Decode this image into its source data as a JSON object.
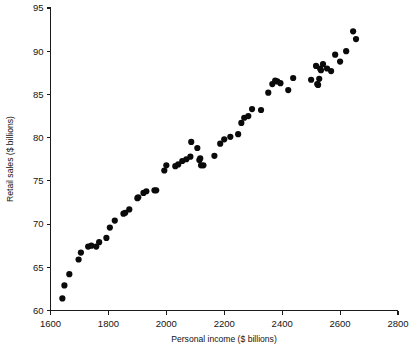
{
  "chart_data": {
    "type": "scatter",
    "title": "",
    "xlabel": "Personal income ($ billions)",
    "ylabel": "Retail sales ($ billions)",
    "xlim": [
      1600,
      2800
    ],
    "ylim": [
      60,
      95
    ],
    "xticks": [
      1600,
      1800,
      2000,
      2200,
      2400,
      2600,
      2800
    ],
    "yticks": [
      60,
      65,
      70,
      75,
      80,
      85,
      90,
      95
    ],
    "xtick_labels": [
      "1600",
      "1800",
      "2000",
      "2200",
      "2400",
      "2600",
      "2800"
    ],
    "ytick_labels": [
      "60",
      "65",
      "70",
      "75",
      "80",
      "85",
      "90",
      "95"
    ],
    "grid": false,
    "legend": null,
    "marker": {
      "shape": "circle",
      "color": "#0a0a0a",
      "size": 3.1
    },
    "point_count": 64,
    "x": [
      1641,
      1648,
      1665,
      1697,
      1705,
      1730,
      1741,
      1758,
      1768,
      1793,
      1805,
      1822,
      1852,
      1858,
      1872,
      1900,
      1903,
      1921,
      1931,
      1959,
      1965,
      1993,
      2000,
      2031,
      2041,
      2055,
      2069,
      2083,
      2086,
      2107,
      2114,
      2117,
      2120,
      2128,
      2166,
      2186,
      2200,
      2221,
      2248,
      2259,
      2269,
      2283,
      2296,
      2327,
      2352,
      2366,
      2376,
      2383,
      2394,
      2421,
      2438,
      2500,
      2517,
      2521,
      2524,
      2528,
      2531,
      2534,
      2541,
      2555,
      2569,
      2583,
      2600,
      2621,
      2645,
      2655
    ],
    "y": [
      61.4,
      62.9,
      64.2,
      65.9,
      66.7,
      67.4,
      67.5,
      67.4,
      67.9,
      68.4,
      69.6,
      70.4,
      71.2,
      71.3,
      71.7,
      73.0,
      73.1,
      73.6,
      73.8,
      73.9,
      73.9,
      76.2,
      76.8,
      76.7,
      76.9,
      77.3,
      77.5,
      77.8,
      79.5,
      78.8,
      77.4,
      77.6,
      76.8,
      76.8,
      77.9,
      79.3,
      79.8,
      80.1,
      80.4,
      81.7,
      82.3,
      82.5,
      83.3,
      83.2,
      85.2,
      86.2,
      86.6,
      86.5,
      86.3,
      85.5,
      86.9,
      86.7,
      88.3,
      86.2,
      86.1,
      86.8,
      88.0,
      87.8,
      88.5,
      88.0,
      87.7,
      89.6,
      88.8,
      90.0,
      92.3,
      91.4
    ]
  }
}
